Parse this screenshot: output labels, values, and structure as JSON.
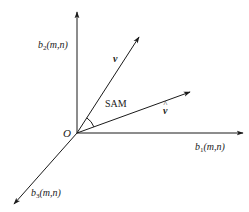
{
  "diagram": {
    "colors": {
      "line": "#1a1a1a",
      "background": "#ffffff"
    },
    "origin": {
      "label": "O"
    },
    "axes": [
      {
        "id": "b2",
        "base": "b",
        "sub": "2",
        "args": "(m,n)",
        "direction": "up"
      },
      {
        "id": "b1",
        "base": "b",
        "sub": "1",
        "args": "(m,n)",
        "direction": "right"
      },
      {
        "id": "b3",
        "base": "b",
        "sub": "3",
        "args": "(m,n)",
        "direction": "down-left"
      }
    ],
    "vectors": [
      {
        "id": "v",
        "label": "v"
      },
      {
        "id": "v_hat",
        "label": "v",
        "accent": "^"
      }
    ],
    "angle": {
      "label": "SAM"
    }
  }
}
